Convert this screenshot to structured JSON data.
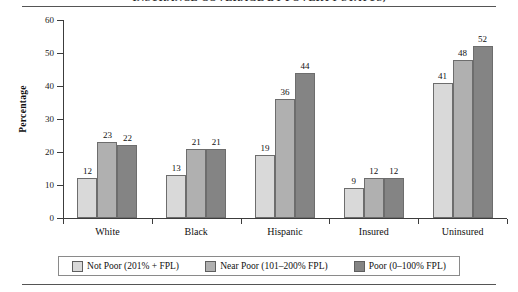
{
  "figure": {
    "title": "INSURANCE COVERAGE BY POVERTY STATUS,",
    "top_rule": "horizontal-rule",
    "bottom_rule": "horizontal-rule"
  },
  "chart_data": {
    "type": "bar",
    "title": "INSURANCE COVERAGE BY POVERTY STATUS,",
    "xlabel": "",
    "ylabel": "Percentage",
    "ylim": [
      0,
      60
    ],
    "yticks": [
      0,
      10,
      20,
      30,
      40,
      50,
      60
    ],
    "grid": false,
    "legend_position": "bottom",
    "categories": [
      "White",
      "Black",
      "Hispanic",
      "Insured",
      "Uninsured"
    ],
    "series": [
      {
        "name": "Not Poor (201% + FPL)",
        "color": "#d9d9d9",
        "values": [
          12,
          13,
          19,
          9,
          41
        ]
      },
      {
        "name": "Near Poor (101–200% FPL)",
        "color": "#b0b0b0",
        "values": [
          23,
          21,
          36,
          12,
          48
        ]
      },
      {
        "name": "Poor (0–100% FPL)",
        "color": "#848484",
        "values": [
          22,
          21,
          44,
          12,
          52
        ]
      }
    ]
  },
  "axis": {
    "y_label": "Percentage",
    "y_ticks": [
      "0",
      "10",
      "20",
      "30",
      "40",
      "50",
      "60"
    ]
  },
  "legend": {
    "items": [
      {
        "label": "Not Poor (201% + FPL)"
      },
      {
        "label": "Near Poor (101–200% FPL)"
      },
      {
        "label": "Poor (0–100% FPL)"
      }
    ]
  }
}
